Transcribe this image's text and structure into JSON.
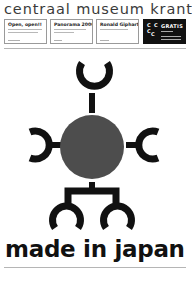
{
  "masthead": {
    "title": "centraal museum krant"
  },
  "teasers": [
    {
      "title": "Open, open!!",
      "page": "pagina 4 t/m 7"
    },
    {
      "title": "Panorama 2000",
      "page": "pagina 8"
    },
    {
      "title": "Ronald Giphart",
      "page": "pagina 11"
    }
  ],
  "promo": {
    "logo_letters": [
      "C",
      "C",
      "C",
      "C"
    ],
    "label": "GRATIS"
  },
  "cover": {
    "headline": "made in japan",
    "colors": {
      "emblem_dark": "#111111",
      "emblem_circle": "#4d4d4d",
      "accent_rule": "#b5b5b5"
    }
  }
}
